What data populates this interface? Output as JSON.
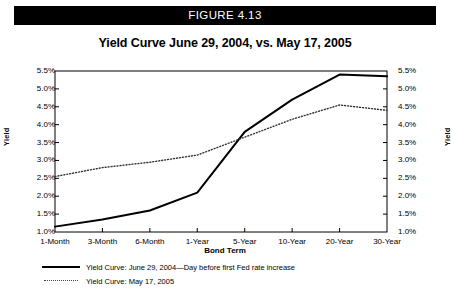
{
  "figure": {
    "banner_label": "FIGURE 4.13",
    "title": "Yield Curve June 29, 2004, vs. May 17, 2005"
  },
  "chart_data": {
    "type": "line",
    "title": "Yield Curve June 29, 2004, vs. May 17, 2005",
    "xlabel": "Bond Term",
    "ylabel": "Yield",
    "ylabel_right": "Yield",
    "categories": [
      "1-Month",
      "3-Month",
      "6-Month",
      "1-Year",
      "5-Year",
      "10-Year",
      "20-Year",
      "30-Year"
    ],
    "ylim": [
      1.0,
      5.5
    ],
    "ytick_values": [
      1.0,
      1.5,
      2.0,
      2.5,
      3.0,
      3.5,
      4.0,
      4.5,
      5.0,
      5.5
    ],
    "ytick_labels": [
      "1.0%",
      "1.5%",
      "2.0%",
      "2.5%",
      "3.0%",
      "3.5%",
      "4.0%",
      "4.5%",
      "5.0%",
      "5.5%"
    ],
    "ytick_labels_right": [
      "1.0%",
      "1.5%",
      "2.0%",
      "2.5%",
      "3.0%",
      "3.5%",
      "4.0%",
      "4.5%",
      "5.0%",
      "5.5%"
    ],
    "grid": false,
    "legend_position": "below-plot-left",
    "series": [
      {
        "name": "Yield Curve:  June 29, 2004—Day before first Fed rate increase",
        "style": "solid",
        "color": "#000000",
        "values": [
          1.15,
          1.35,
          1.6,
          2.1,
          3.8,
          4.7,
          5.4,
          5.35
        ]
      },
      {
        "name": "Yield Curve: May 17, 2005",
        "style": "dotted",
        "color": "#333333",
        "values": [
          2.55,
          2.8,
          2.95,
          3.15,
          3.65,
          4.15,
          4.55,
          4.4
        ]
      }
    ]
  },
  "legend": {
    "items": [
      {
        "label": "Yield Curve:  June 29, 2004—Day before first Fed rate increase",
        "style": "solid"
      },
      {
        "label": "Yield Curve: May 17, 2005",
        "style": "dotted"
      }
    ]
  }
}
